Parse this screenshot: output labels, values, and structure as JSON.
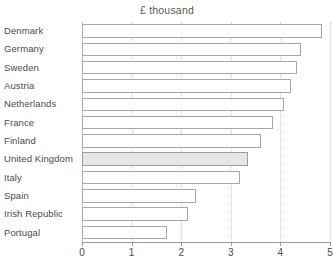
{
  "chart_data": {
    "type": "bar",
    "orientation": "horizontal",
    "title": "£ thousand",
    "xlabel": "",
    "ylabel": "",
    "xlim": [
      0,
      5
    ],
    "xticks": [
      0,
      1,
      2,
      3,
      4,
      5
    ],
    "xtick_labels": [
      "0",
      "1",
      "2",
      "3",
      "4",
      "5"
    ],
    "grid": "vertical-dotted",
    "legend": "none",
    "highlight_category": "United Kingdom",
    "highlight_color": "#e6e6e6",
    "bar_edge_color": "#a7a7a9",
    "bar_fill_color": "#ffffff",
    "categories": [
      "Denmark",
      "Germany",
      "Sweden",
      "Austria",
      "Netherlands",
      "France",
      "Finland",
      "United Kingdom",
      "Italy",
      "Spain",
      "Irish Republic",
      "Portugal"
    ],
    "values": [
      4.84,
      4.42,
      4.33,
      4.21,
      4.07,
      3.85,
      3.61,
      3.35,
      3.18,
      2.3,
      2.14,
      1.71
    ]
  }
}
